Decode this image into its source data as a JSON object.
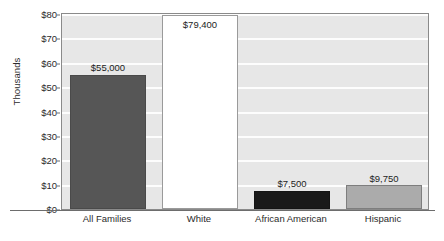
{
  "chart_data": {
    "type": "bar",
    "title": "",
    "subtitle": "",
    "xlabel": "",
    "ylabel": "Thousands",
    "ylim": [
      0,
      80
    ],
    "ytick_values": [
      0,
      10,
      20,
      30,
      40,
      50,
      60,
      70,
      80
    ],
    "ytick_labels": [
      "$0",
      "$10",
      "$20",
      "$30",
      "$40",
      "$50",
      "$60",
      "$70",
      "$80"
    ],
    "grid": true,
    "legend": "none",
    "categories": [
      "All Families",
      "White",
      "African American",
      "Hispanic"
    ],
    "values": [
      55000,
      79400,
      7500,
      9750
    ],
    "value_labels": [
      "$55,000",
      "$79,400",
      "$7,500",
      "$9,750"
    ],
    "bars": [
      {
        "category": "All Families",
        "value": 55000,
        "value_in_thousands": 55.0,
        "value_label": "$55,000",
        "fill": "#565656",
        "fill_name": "dark-gray",
        "label_position": "above"
      },
      {
        "category": "White",
        "value": 79400,
        "value_in_thousands": 79.4,
        "value_label": "$79,400",
        "fill": "#ffffff",
        "fill_name": "white-fill",
        "label_position": "inside"
      },
      {
        "category": "African American",
        "value": 7500,
        "value_in_thousands": 7.5,
        "value_label": "$7,500",
        "fill": "#191919",
        "fill_name": "black-fill",
        "label_position": "above"
      },
      {
        "category": "Hispanic",
        "value": 9750,
        "value_in_thousands": 9.75,
        "value_label": "$9,750",
        "fill": "#ababab",
        "fill_name": "mid-gray",
        "label_position": "above"
      }
    ],
    "colors": {
      "plot_background": "#e7e7e7",
      "gridline": "#fdfdfd",
      "axis": "#6d6d6d",
      "plot_border": "#8a8a8a",
      "text": "#1d1d1d"
    }
  }
}
